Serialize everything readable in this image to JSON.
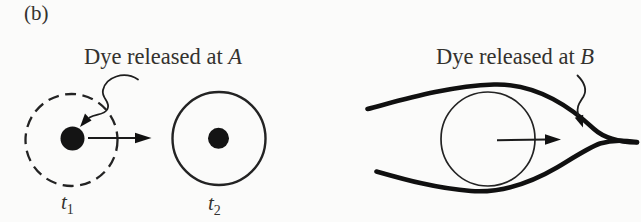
{
  "figure": {
    "panel_label": "(b)",
    "colors": {
      "ink": "#1e1e1e",
      "streamline": "#101010",
      "dye_blob": "#141414",
      "text": "#34322e",
      "background": "#fbfbfa"
    }
  },
  "left_panel": {
    "caption_prefix": "Dye released at ",
    "caption_point": "A",
    "time1": {
      "base": "t",
      "sub": "1"
    },
    "time2": {
      "base": "t",
      "sub": "2"
    }
  },
  "right_panel": {
    "caption_prefix": "Dye released at ",
    "caption_point": "B"
  }
}
